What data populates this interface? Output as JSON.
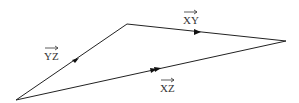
{
  "diagram": {
    "type": "vector-triangle",
    "colors": {
      "line": "#222222",
      "label": "#333333",
      "background": "#ffffff"
    },
    "vertices": [
      {
        "id": "bottom-left",
        "x": 16,
        "y": 100
      },
      {
        "id": "top",
        "x": 127,
        "y": 24
      },
      {
        "id": "right",
        "x": 286,
        "y": 41
      }
    ],
    "edges": [
      {
        "id": "xy",
        "label": "XY",
        "arrow": "single",
        "from": "top",
        "to": "right"
      },
      {
        "id": "yz",
        "label": "YZ",
        "arrow": "single",
        "from": "bottom-left",
        "to": "top"
      },
      {
        "id": "xz",
        "label": "XZ",
        "arrow": "double",
        "from": "bottom-left",
        "to": "right"
      }
    ],
    "labels": {
      "xy": "XY",
      "yz": "YZ",
      "xz": "XZ"
    }
  }
}
